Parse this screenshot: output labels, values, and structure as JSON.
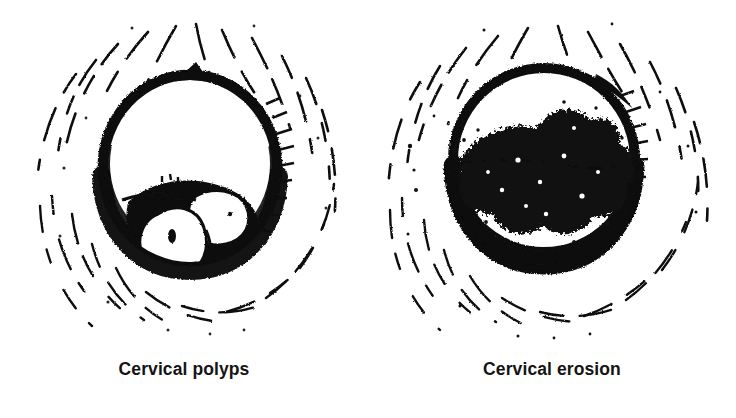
{
  "plate": {
    "background_color": "#ffffff",
    "ink_color": "#111111",
    "panel_count": 2
  },
  "figures": [
    {
      "id": "cervical-polyps",
      "caption": "Cervical polyps",
      "subject": "speculum view of cervix showing pedunculated polyps protruding from the external os",
      "lesion_type": "polyps",
      "lesion_count": 2,
      "lesion_fill": "white-highlight",
      "ring_label": "cervical os ring",
      "surround_label": "vaginal wall rugae"
    },
    {
      "id": "cervical-erosion",
      "caption": "Cervical erosion",
      "subject": "speculum view of cervix showing an irregular eroded area around the external os",
      "lesion_type": "erosion",
      "lesion_count": 1,
      "lesion_fill": "stippled-dark",
      "ring_label": "cervical os ring",
      "surround_label": "vaginal wall rugae"
    }
  ]
}
